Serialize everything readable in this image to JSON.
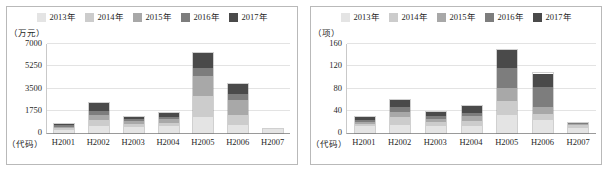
{
  "figure": {
    "series_colors": [
      "#e4e4e4",
      "#cccccc",
      "#a8a8a8",
      "#7d7d7d",
      "#4a4a4a"
    ],
    "background": "#ffffff",
    "frame_color": "#b9b9b9",
    "grid_color": "#e3e3e3"
  },
  "legend": {
    "items": [
      {
        "label": "2013年",
        "color": "#e4e4e4",
        "swatch_name": "legend-swatch-2013"
      },
      {
        "label": "2014年",
        "color": "#cccccc",
        "swatch_name": "legend-swatch-2014"
      },
      {
        "label": "2015年",
        "color": "#a8a8a8",
        "swatch_name": "legend-swatch-2015"
      },
      {
        "label": "2016年",
        "color": "#7d7d7d",
        "swatch_name": "legend-swatch-2016"
      },
      {
        "label": "2017年",
        "color": "#4a4a4a",
        "swatch_name": "legend-swatch-2017"
      }
    ]
  },
  "chart_data": [
    {
      "type": "bar",
      "id": "left-chart",
      "stacked": true,
      "title": "",
      "unit_label": "（万元）",
      "xlabel": "（代码）",
      "ylabel": "万元",
      "grid": true,
      "legend_position": "top-center",
      "ylim": [
        0,
        7000
      ],
      "yticks": [
        0,
        1750,
        3500,
        5250,
        7000
      ],
      "ytick_labels": [
        "0",
        "1750",
        "3500",
        "5250",
        "7000"
      ],
      "categories": [
        "H2001",
        "H2002",
        "H2003",
        "H2004",
        "H2005",
        "H2006",
        "H2007"
      ],
      "series": [
        {
          "name": "2013年",
          "color": "#e4e4e4",
          "values": [
            260,
            560,
            460,
            590,
            1250,
            640,
            320
          ]
        },
        {
          "name": "2014年",
          "color": "#cccccc",
          "values": [
            130,
            430,
            240,
            200,
            1630,
            790,
            0
          ]
        },
        {
          "name": "2015年",
          "color": "#a8a8a8",
          "values": [
            110,
            390,
            210,
            320,
            1600,
            1130,
            0
          ]
        },
        {
          "name": "2016年",
          "color": "#7d7d7d",
          "values": [
            130,
            380,
            160,
            170,
            630,
            480,
            0
          ]
        },
        {
          "name": "2017年",
          "color": "#4a4a4a",
          "values": [
            110,
            640,
            210,
            320,
            1190,
            810,
            0
          ]
        }
      ],
      "totals": [
        740,
        2400,
        1280,
        1600,
        6300,
        3850,
        320
      ]
    },
    {
      "type": "bar",
      "id": "right-chart",
      "stacked": true,
      "title": "",
      "unit_label": "（项）",
      "xlabel": "（代码）",
      "ylabel": "项",
      "grid": true,
      "legend_position": "top-center",
      "ylim": [
        0,
        160
      ],
      "yticks": [
        0,
        40,
        80,
        120,
        160
      ],
      "ytick_labels": [
        "0",
        "40",
        "80",
        "120",
        "160"
      ],
      "categories": [
        "H2001",
        "H2002",
        "H2003",
        "H2004",
        "H2005",
        "H2006",
        "H2007"
      ],
      "series": [
        {
          "name": "2013年",
          "color": "#e4e4e4",
          "values": [
            12,
            15,
            12,
            13,
            33,
            24,
            9
          ]
        },
        {
          "name": "2014年",
          "color": "#cccccc",
          "values": [
            4,
            13,
            7,
            8,
            24,
            11,
            6
          ]
        },
        {
          "name": "2015年",
          "color": "#a8a8a8",
          "values": [
            4,
            10,
            7,
            9,
            24,
            11,
            2
          ]
        },
        {
          "name": "2016年",
          "color": "#7d7d7d",
          "values": [
            3,
            9,
            5,
            6,
            36,
            37,
            1
          ]
        },
        {
          "name": "2017年",
          "color": "#4a4a4a",
          "values": [
            5,
            13,
            6,
            13,
            33,
            24,
            0
          ]
        }
      ],
      "totals": [
        28,
        60,
        37,
        49,
        150,
        107,
        18
      ]
    }
  ]
}
